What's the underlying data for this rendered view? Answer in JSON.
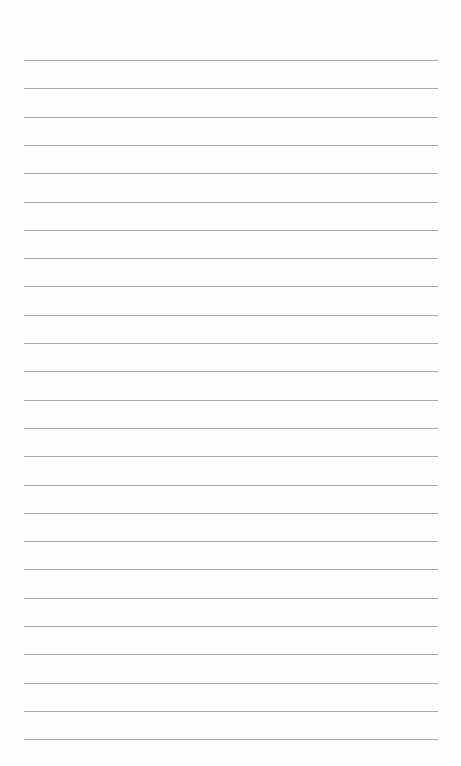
{
  "page": {
    "type": "lined-paper",
    "background_color": "#fefefe",
    "line_color": "#a9a9a9",
    "line_count": 25,
    "first_line_y": 60,
    "line_spacing": 28.3,
    "line_left": 24,
    "line_right": 438
  }
}
